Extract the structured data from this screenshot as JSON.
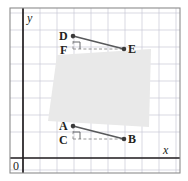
{
  "figure": {
    "background_color": "#ffffff",
    "frame": {
      "color": "#8c8c8c",
      "x": 10,
      "y": 8,
      "width": 170,
      "height": 165
    },
    "grid": {
      "color": "#c9c9d6",
      "spacing": 17,
      "visible": true
    },
    "axes": {
      "color": "#231f20",
      "x_axis_y": 158,
      "y_axis_x": 23,
      "x_label": "x",
      "y_label": "y",
      "origin_label": "0",
      "x_label_pos": {
        "x": 163,
        "y": 144
      },
      "y_label_pos": {
        "x": 27,
        "y": 13
      },
      "origin_label_pos": {
        "x": 12,
        "y": 160
      }
    },
    "shaded_region": {
      "name": "rotated-square-shading",
      "fill": "#e9e9e9",
      "points": "57,55 151,49 149,127 48,121"
    },
    "segments": [
      {
        "name": "segment-DE",
        "color": "#58595b",
        "x1": 73,
        "y1": 36,
        "x2": 124,
        "y2": 49,
        "style": "solid",
        "width": 1.6
      },
      {
        "name": "segment-AB",
        "color": "#58595b",
        "x1": 73,
        "y1": 126,
        "x2": 124,
        "y2": 139,
        "style": "solid",
        "width": 1.6
      }
    ],
    "dashed_legs": [
      {
        "name": "leg-DF",
        "color": "#8a8a8a",
        "x1": 73,
        "y1": 36,
        "x2": 73,
        "y2": 49,
        "style": "dashed"
      },
      {
        "name": "leg-FE",
        "color": "#8a8a8a",
        "x1": 73,
        "y1": 49,
        "x2": 124,
        "y2": 49,
        "style": "dashed"
      },
      {
        "name": "leg-AC",
        "color": "#8a8a8a",
        "x1": 73,
        "y1": 126,
        "x2": 73,
        "y2": 139,
        "style": "dashed"
      },
      {
        "name": "leg-CB",
        "color": "#8a8a8a",
        "x1": 73,
        "y1": 139,
        "x2": 124,
        "y2": 139,
        "style": "dashed"
      }
    ],
    "right_angle_marks": [
      {
        "name": "right-angle-mark-F",
        "color": "#58595b",
        "points": "73,42 80,42 80,49"
      },
      {
        "name": "right-angle-mark-C",
        "color": "#58595b",
        "points": "73,132 80,132 80,139"
      }
    ],
    "points": [
      {
        "name": "point-D",
        "label": "D",
        "x": 73,
        "y": 36,
        "label_x": 59,
        "label_y": 30,
        "dot": true
      },
      {
        "name": "point-E",
        "label": "E",
        "x": 124,
        "y": 49,
        "label_x": 128,
        "label_y": 43,
        "dot": true
      },
      {
        "name": "point-F",
        "label": "F",
        "x": 73,
        "y": 49,
        "label_x": 60,
        "label_y": 44,
        "dot": false
      },
      {
        "name": "point-A",
        "label": "A",
        "x": 73,
        "y": 126,
        "label_x": 59,
        "label_y": 120,
        "dot": true
      },
      {
        "name": "point-B",
        "label": "B",
        "x": 124,
        "y": 139,
        "label_x": 128,
        "label_y": 133,
        "dot": true
      },
      {
        "name": "point-C",
        "label": "C",
        "x": 73,
        "y": 139,
        "label_x": 59,
        "label_y": 134,
        "dot": false
      }
    ],
    "point_dot": {
      "color": "#3b3b3b",
      "radius": 2.3
    }
  }
}
